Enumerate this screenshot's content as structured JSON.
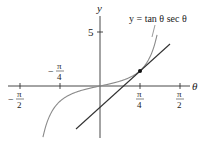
{
  "figure": {
    "equation_label": "y = tan θ sec θ",
    "axes": {
      "x_label": "θ",
      "y_label": "y",
      "y_tick": "5",
      "x_ticks": [
        {
          "num": "π",
          "den": "2",
          "sign": "−",
          "pos": -1.5708
        },
        {
          "num": "π",
          "den": "4",
          "sign": "−",
          "pos": -0.7854
        },
        {
          "num": "π",
          "den": "4",
          "sign": "",
          "pos": 0.7854
        },
        {
          "num": "π",
          "den": "2",
          "sign": "",
          "pos": 1.5708
        }
      ]
    },
    "colors": {
      "axis": "#333333",
      "curve": "#8a8a8a",
      "tangent": "#333333",
      "point": "#111111"
    },
    "tangent_point": {
      "theta": 0.7854,
      "y": 1.4142
    }
  },
  "chart_data": {
    "type": "line",
    "title": "y = tan θ sec θ",
    "xlabel": "θ",
    "ylabel": "y",
    "xlim": [
      -1.8,
      1.8
    ],
    "ylim": [
      -5,
      8
    ],
    "x_tick_labels": [
      "−π/2",
      "−π/4",
      "π/4",
      "π/2"
    ],
    "y_tick_labels": [
      "5"
    ],
    "grid": false,
    "series": [
      {
        "name": "y = tan θ sec θ",
        "kind": "curve",
        "x": [
          -1.24,
          -1.0,
          -0.7854,
          -0.5,
          -0.25,
          0,
          0.25,
          0.5,
          0.7854,
          1.0,
          1.13
        ],
        "y": [
          -9.0,
          -2.88,
          -1.414,
          -0.62,
          -0.26,
          0,
          0.26,
          0.62,
          1.414,
          2.88,
          5.0
        ]
      },
      {
        "name": "tangent line at θ = π/4",
        "kind": "line",
        "slope": 4.243,
        "point": [
          0.7854,
          1.4142
        ]
      }
    ],
    "annotations": [
      {
        "text": "tangent point",
        "x": 0.7854,
        "y": 1.4142
      }
    ]
  }
}
